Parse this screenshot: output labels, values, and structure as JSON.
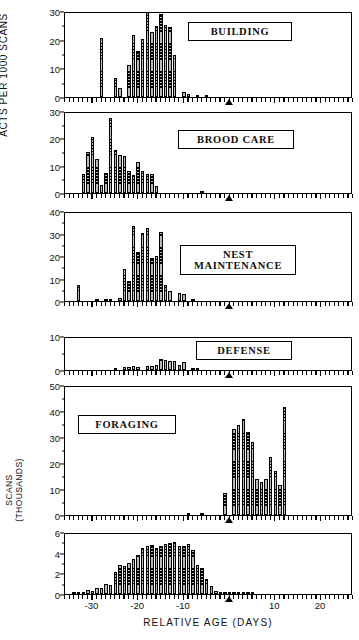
{
  "figure": {
    "y_axis_label": "ACTS PER 1000 SCANS",
    "x_axis_label": "RELATIVE AGE  (DAYS)",
    "x_tick_labels": [
      "-30",
      "-20",
      "-10",
      "10",
      "20"
    ],
    "x_tick_values": [
      -30,
      -20,
      -10,
      10,
      20
    ],
    "x_range": [
      -36,
      27
    ],
    "marker_day": 0,
    "marker_name": "triangle-marker",
    "bar_fill_color": "#b9b9b9",
    "bar_edge_color": "#000000"
  },
  "chart_data": {
    "type": "bar",
    "title": "",
    "xlabel": "RELATIVE AGE  (DAYS)",
    "ylabel": "ACTS PER 1000 SCANS",
    "grid": false,
    "legend": "none",
    "x": [
      -35,
      -34,
      -33,
      -32,
      -31,
      -30,
      -29,
      -28,
      -27,
      -26,
      -25,
      -24,
      -23,
      -22,
      -21,
      -20,
      -19,
      -18,
      -17,
      -16,
      -15,
      -14,
      -13,
      -12,
      -11,
      -10,
      -9,
      -8,
      -7,
      -6,
      -5,
      -4,
      -3,
      -2,
      -1,
      0,
      1,
      2,
      3,
      4,
      5,
      6,
      7,
      8,
      9,
      10,
      11,
      12,
      13,
      14,
      15,
      16,
      17,
      18,
      19,
      20,
      21,
      22,
      23,
      24,
      25,
      26
    ],
    "panels": [
      {
        "name": "BUILDING",
        "ylabel": "",
        "ylim": [
          0,
          30
        ],
        "yticks": [
          0,
          10,
          20,
          30
        ],
        "values": [
          0,
          0,
          0,
          0,
          0,
          0,
          0,
          20.5,
          0,
          0,
          6.8,
          3.1,
          0,
          11.3,
          21.6,
          16.1,
          20.4,
          29.6,
          22.6,
          24.6,
          28.8,
          25.0,
          24.5,
          14.7,
          0,
          1.8,
          0.9,
          0,
          0.5,
          0,
          0.4,
          0,
          0,
          0,
          0,
          0,
          0,
          0,
          0,
          0,
          0,
          0,
          0,
          0,
          0,
          0,
          0,
          0,
          0,
          0,
          0,
          0,
          0,
          0,
          0,
          0,
          0,
          0,
          0,
          0,
          0,
          0
        ]
      },
      {
        "name": "BROOD  CARE",
        "ylabel": "",
        "ylim": [
          0,
          30
        ],
        "yticks": [
          0,
          10,
          20,
          30
        ],
        "values": [
          0,
          0,
          0,
          6.9,
          14.9,
          20.5,
          12.5,
          3.0,
          7.5,
          27.6,
          15.7,
          14.0,
          13.5,
          8.0,
          6.5,
          11.2,
          8.2,
          6.8,
          6.9,
          2.6,
          0,
          0,
          0,
          0,
          0,
          0,
          0,
          0,
          0,
          0.4,
          0,
          0,
          0,
          0,
          0,
          0,
          0,
          0,
          0,
          0,
          0,
          0,
          0,
          0,
          0,
          0,
          0,
          0,
          0,
          0,
          0,
          0,
          0,
          0,
          0,
          0,
          0,
          0,
          0,
          0,
          0,
          0
        ]
      },
      {
        "name": "NEST\nMAINTENANCE",
        "ylabel": "",
        "ylim": [
          0,
          40
        ],
        "yticks": [
          0,
          10,
          20,
          30,
          40
        ],
        "values": [
          0,
          0,
          6.9,
          0,
          0,
          0,
          0.8,
          0,
          0.5,
          0.7,
          0,
          1.3,
          14.4,
          8.7,
          33.4,
          21.8,
          30.1,
          32.3,
          19.3,
          20.1,
          30.6,
          7.2,
          4.3,
          0,
          3.6,
          3.3,
          0,
          0.6,
          0,
          0,
          0,
          0,
          0,
          0,
          0,
          0,
          0,
          0,
          0,
          0,
          0,
          0,
          0,
          0,
          0,
          0,
          0,
          0,
          0,
          0,
          0,
          0,
          0,
          0,
          0,
          0,
          0,
          0,
          0,
          0,
          0,
          0
        ]
      },
      {
        "name": "DEFENSE",
        "ylabel": "",
        "ylim": [
          0,
          10
        ],
        "yticks": [
          0,
          10
        ],
        "values": [
          0,
          0,
          0,
          0,
          0,
          0,
          0,
          0,
          0,
          0,
          0.5,
          0,
          0.9,
          1.0,
          1.1,
          1.0,
          0,
          1.1,
          1.3,
          1.6,
          3.2,
          3.0,
          2.7,
          2.6,
          1.5,
          2.5,
          0,
          0.5,
          0.4,
          0,
          0,
          0,
          0,
          0,
          0,
          0,
          0,
          0,
          0,
          0,
          0,
          0,
          0,
          0,
          0,
          0,
          0,
          0,
          0,
          0,
          0,
          0,
          0,
          0,
          0,
          0,
          0,
          0,
          0,
          0,
          0,
          0
        ]
      },
      {
        "name": "FORAGING",
        "ylabel": "",
        "ylim": [
          0,
          50
        ],
        "yticks": [
          0,
          10,
          20,
          30,
          40,
          50
        ],
        "values": [
          0,
          0,
          0,
          0,
          0,
          0,
          0,
          0,
          0,
          0,
          0,
          0,
          0,
          0,
          0,
          0,
          0,
          0,
          0,
          0,
          0,
          0,
          0,
          0,
          0,
          0,
          0.5,
          0,
          0,
          0.3,
          0,
          0,
          0,
          0,
          8.5,
          0,
          33.0,
          34.6,
          36.8,
          31.8,
          28.2,
          13.9,
          12.8,
          13.8,
          22.5,
          17.0,
          11.6,
          41.7,
          0,
          0,
          0,
          0,
          0,
          0,
          0,
          0,
          0,
          0,
          0,
          0,
          0,
          0
        ]
      },
      {
        "name": "SCANS",
        "ylabel": "SCANS\n(THOUSANDS)",
        "ylim": [
          0,
          6
        ],
        "yticks": [
          0,
          2,
          4,
          6
        ],
        "values": [
          0,
          0.05,
          0.1,
          0.12,
          0.35,
          0.3,
          0.55,
          0.6,
          0.95,
          0.9,
          2.15,
          2.85,
          2.7,
          3.0,
          3.4,
          3.75,
          4.5,
          4.6,
          4.7,
          4.5,
          4.6,
          4.85,
          4.9,
          5.0,
          4.6,
          4.65,
          4.8,
          4.25,
          2.8,
          2.5,
          1.5,
          0.75,
          0.3,
          0.2,
          0.15,
          0.12,
          0.1,
          0.08,
          0.05,
          0.05,
          0.04,
          0,
          0,
          0,
          0,
          0,
          0,
          0,
          0,
          0,
          0,
          0,
          0,
          0,
          0,
          0,
          0,
          0,
          0,
          0,
          0,
          0
        ]
      }
    ]
  },
  "panel_tags": [
    {
      "label": "BUILDING"
    },
    {
      "label": "BROOD  CARE"
    },
    {
      "label": "NEST\nMAINTENANCE"
    },
    {
      "label": "DEFENSE"
    },
    {
      "label": "FORAGING"
    }
  ]
}
